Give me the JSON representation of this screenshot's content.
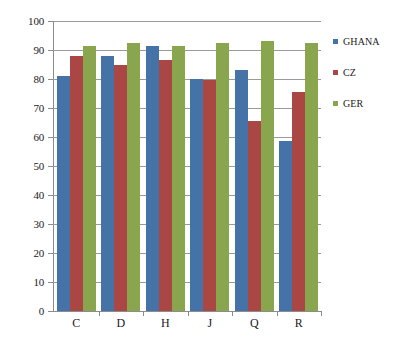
{
  "chart_data": {
    "type": "bar",
    "title": "",
    "subtitle": "",
    "xlabel": "",
    "ylabel": "",
    "categories": [
      "C",
      "D",
      "H",
      "J",
      "Q",
      "R"
    ],
    "series": [
      {
        "name": "GHANA",
        "color": "#4572a7",
        "values": [
          81,
          88,
          91.5,
          80,
          83,
          58.5
        ]
      },
      {
        "name": "CZ",
        "color": "#aa4643",
        "values": [
          88,
          85,
          86.5,
          79.5,
          65.5,
          75.5
        ]
      },
      {
        "name": "GER",
        "color": "#89a54e",
        "values": [
          91.5,
          92.5,
          91.5,
          92.5,
          93,
          92.5
        ]
      }
    ],
    "ylim": [
      0,
      100
    ],
    "ytick_step": 10,
    "yticks": [
      0,
      10,
      20,
      30,
      40,
      50,
      60,
      70,
      80,
      90,
      100
    ],
    "ytick_labels": [
      "0",
      "10",
      "20",
      "30",
      "40",
      "50",
      "60",
      "70",
      "80",
      "90",
      "100"
    ],
    "grid": true,
    "grid_axis": "y",
    "legend": true,
    "legend_position": "right",
    "legend_entries": [
      "GHANA",
      "CZ",
      "GER"
    ],
    "gridline_color": "#9a9a9a",
    "axis_color": "#8c8c8c",
    "background_color": "#ffffff",
    "text_color": "#1a1a1a"
  }
}
